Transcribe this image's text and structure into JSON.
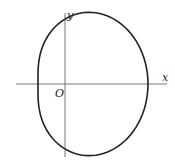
{
  "diagram": {
    "type": "polar-curve",
    "curve": "limacon",
    "axes": {
      "x_label": "x",
      "y_label": "y",
      "origin_label": "O"
    },
    "colors": {
      "stroke": "#222222",
      "axis": "#444444",
      "background": "#ffffff"
    }
  }
}
